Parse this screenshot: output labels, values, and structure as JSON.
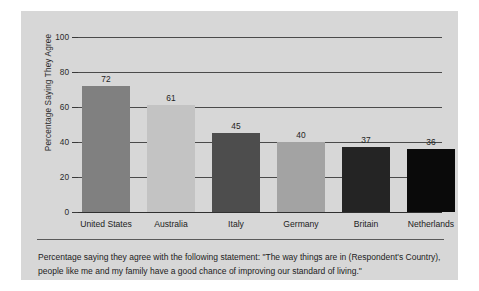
{
  "chart_data": {
    "type": "bar",
    "title": "",
    "xlabel": "",
    "ylabel": "Percentage Saying They Agree",
    "ylim": [
      0,
      100
    ],
    "yticks": [
      0,
      20,
      40,
      60,
      80,
      100
    ],
    "grid": true,
    "legend": "none",
    "categories": [
      "United States",
      "Australia",
      "Italy",
      "Germany",
      "Britain",
      "Netherlands"
    ],
    "values": [
      72,
      61,
      45,
      40,
      37,
      36
    ],
    "value_labels": [
      "72",
      "61",
      "45",
      "40",
      "37",
      "36"
    ],
    "tick_labels": [
      "0",
      "20",
      "40",
      "60",
      "80",
      "100"
    ],
    "bar_colors": [
      "#808080",
      "#c3c3c3",
      "#4d4d4d",
      "#a3a3a3",
      "#242424",
      "#0a0a0a"
    ]
  },
  "figure": {
    "background_color": "#d7d7d7",
    "page_color": "#ffffff",
    "caption_line_1": "Percentage saying they agree with the following statement: \"The way things are in (Respondent's",
    "caption_line_2": "Country), people like me and my family have a good chance of improving our standard of living.\""
  }
}
